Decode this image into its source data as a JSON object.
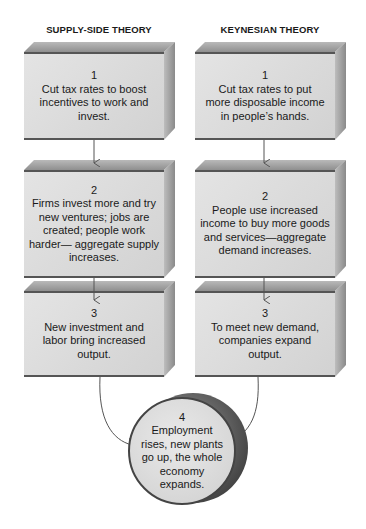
{
  "columns": [
    {
      "title": "SUPPLY-SIDE THEORY",
      "steps": [
        {
          "number": "1",
          "text": "Cut tax rates to boost incentives to work and invest."
        },
        {
          "number": "2",
          "text": "Firms invest more and try new ventures; jobs are created; people work harder— aggregate supply increases."
        },
        {
          "number": "3",
          "text": "New investment and labor bring increased output."
        }
      ]
    },
    {
      "title": "KEYNESIAN THEORY",
      "steps": [
        {
          "number": "1",
          "text": "Cut tax rates to put more disposable income in people’s hands."
        },
        {
          "number": "2",
          "text": "People use increased income to buy more goods and services—aggregate demand increases."
        },
        {
          "number": "3",
          "text": "To meet new demand, companies expand output."
        }
      ]
    }
  ],
  "outcome": {
    "number": "4",
    "text": "Employment rises, new plants go up, the whole economy expands."
  },
  "colors": {
    "box_front": "#d8d8d8",
    "box_top": "#a0a0a0",
    "box_side": "#9a9a9a",
    "edge": "#555555",
    "arrow": "#555555"
  }
}
